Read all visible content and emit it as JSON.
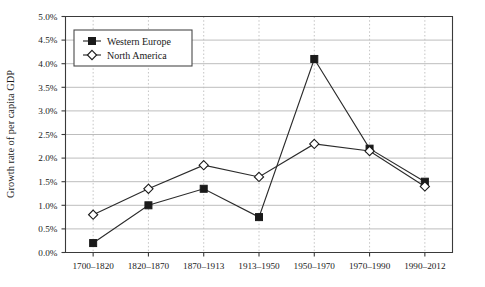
{
  "chart_data": {
    "type": "line",
    "title": "",
    "xlabel": "",
    "ylabel": "Growth rate of per capita GDP",
    "categories": [
      "1700–1820",
      "1820–1870",
      "1870–1913",
      "1913–1950",
      "1950–1970",
      "1970–1990",
      "1990–2012"
    ],
    "series": [
      {
        "name": "Western Europe",
        "marker": "filled-square",
        "values": [
          0.2,
          1.0,
          1.35,
          0.75,
          4.1,
          2.2,
          1.5
        ]
      },
      {
        "name": "North America",
        "marker": "open-diamond",
        "values": [
          0.8,
          1.35,
          1.85,
          1.6,
          2.3,
          2.15,
          1.4
        ]
      }
    ],
    "ylim": [
      0.0,
      5.0
    ],
    "ytick_values": [
      0.0,
      0.5,
      1.0,
      1.5,
      2.0,
      2.5,
      3.0,
      3.5,
      4.0,
      4.5,
      5.0
    ],
    "ytick_labels": [
      "0.0%",
      "0.5%",
      "1.0%",
      "1.5%",
      "2.0%",
      "2.5%",
      "3.0%",
      "3.5%",
      "4.0%",
      "4.5%",
      "5.0%"
    ],
    "grid": {
      "horizontal": true,
      "vertical": true,
      "horizontal_style": "solid",
      "vertical_style": "dotted"
    },
    "legend": {
      "position": "top-left",
      "entries": [
        "Western Europe",
        "North America"
      ]
    },
    "colors": {
      "line": "#2b2b2b",
      "grid_horizontal": "#b6b6b6",
      "grid_vertical": "#bdbdbd",
      "axis": "#3a3a3a",
      "background": "#ffffff",
      "marker_fill_series1": "#1a1a1a",
      "marker_fill_series2": "#ffffff"
    }
  }
}
